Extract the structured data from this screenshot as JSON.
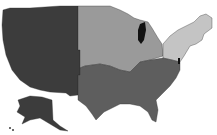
{
  "map": {
    "type": "choropleth",
    "subject": "United States census regions",
    "regions": [
      {
        "name": "West",
        "fill": "#3c3c3c"
      },
      {
        "name": "Midwest",
        "fill": "#9a9a9a"
      },
      {
        "name": "South",
        "fill": "#5e5e5e"
      },
      {
        "name": "Northeast",
        "fill": "#c4c4c4"
      }
    ],
    "water": {
      "name": "Lake Michigan",
      "fill": "#111111"
    }
  }
}
